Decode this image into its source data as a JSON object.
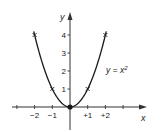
{
  "chart_data": {
    "type": "line",
    "title": "",
    "xlabel": "x",
    "ylabel": "y",
    "xlim": [
      -3,
      3.2
    ],
    "ylim": [
      -1.3,
      4.7
    ],
    "grid": false,
    "legend": null,
    "x_ticks": [
      -3,
      -2,
      -1,
      1,
      2,
      3
    ],
    "x_tick_labels": [
      "",
      "−2",
      "−1",
      "+1",
      "+2",
      ""
    ],
    "y_ticks": [
      1,
      2,
      3,
      4
    ],
    "y_tick_labels": [
      "1",
      "2",
      "3",
      "4"
    ],
    "series": [
      {
        "name": "y = x²",
        "function": "x^2",
        "x_range": [
          -2.05,
          2.05
        ],
        "marked_points": [
          {
            "x": -2,
            "y": 4
          },
          {
            "x": -1,
            "y": 1
          },
          {
            "x": 0,
            "y": 0
          },
          {
            "x": 1,
            "y": 1
          },
          {
            "x": 2,
            "y": 4
          }
        ]
      }
    ],
    "annotations": [
      {
        "text": "y = x²",
        "x": 1.9,
        "y": 2
      }
    ]
  },
  "labels": {
    "x_axis": "x",
    "y_axis": "y",
    "equation_lhs": "y = x",
    "equation_exp": "2",
    "x_ticks": [
      "−2",
      "−1",
      "+1",
      "+2"
    ],
    "y_ticks": [
      "1",
      "2",
      "3",
      "4"
    ]
  },
  "colors": {
    "line": "#1a1a1a",
    "axis": "#333333",
    "text": "#222222"
  }
}
